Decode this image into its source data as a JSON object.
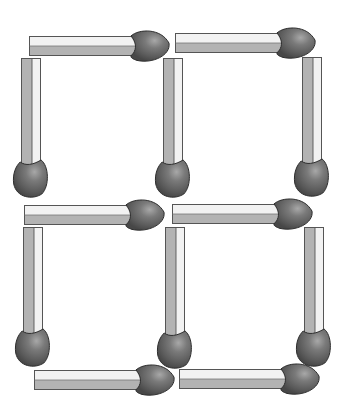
{
  "puzzle": {
    "type": "matchstick-squares",
    "grid": "2x2",
    "match_count": 12,
    "colors": {
      "background": "#ffffff",
      "stick_light": "#f2f2f2",
      "stick_shade": "#b3b3b3",
      "stick_outline": "#555555",
      "head_fill": "#5c5c5c",
      "head_highlight": "#a8a8a8",
      "head_outline": "#2e2e2e"
    },
    "matches": [
      {
        "id": "top-left-h",
        "orientation": "horizontal",
        "x": 29,
        "y": 36,
        "length": 110,
        "head": "right"
      },
      {
        "id": "top-right-h",
        "orientation": "horizontal",
        "x": 175,
        "y": 33,
        "length": 110,
        "head": "right"
      },
      {
        "id": "top-left-v",
        "orientation": "vertical",
        "x": 21,
        "y": 58,
        "length": 110,
        "head": "bottom"
      },
      {
        "id": "top-mid-v",
        "orientation": "vertical",
        "x": 163,
        "y": 58,
        "length": 110,
        "head": "bottom"
      },
      {
        "id": "top-right-v",
        "orientation": "vertical",
        "x": 302,
        "y": 57,
        "length": 110,
        "head": "bottom"
      },
      {
        "id": "mid-left-h",
        "orientation": "horizontal",
        "x": 24,
        "y": 205,
        "length": 110,
        "head": "right"
      },
      {
        "id": "mid-right-h",
        "orientation": "horizontal",
        "x": 172,
        "y": 204,
        "length": 110,
        "head": "right"
      },
      {
        "id": "bot-left-v",
        "orientation": "vertical",
        "x": 23,
        "y": 227,
        "length": 110,
        "head": "bottom"
      },
      {
        "id": "bot-mid-v",
        "orientation": "vertical",
        "x": 165,
        "y": 227,
        "length": 112,
        "head": "bottom"
      },
      {
        "id": "bot-right-v",
        "orientation": "vertical",
        "x": 304,
        "y": 227,
        "length": 110,
        "head": "bottom"
      },
      {
        "id": "bot-left-h",
        "orientation": "horizontal",
        "x": 34,
        "y": 370,
        "length": 110,
        "head": "right"
      },
      {
        "id": "bot-right-h",
        "orientation": "horizontal",
        "x": 179,
        "y": 369,
        "length": 110,
        "head": "right"
      }
    ]
  }
}
